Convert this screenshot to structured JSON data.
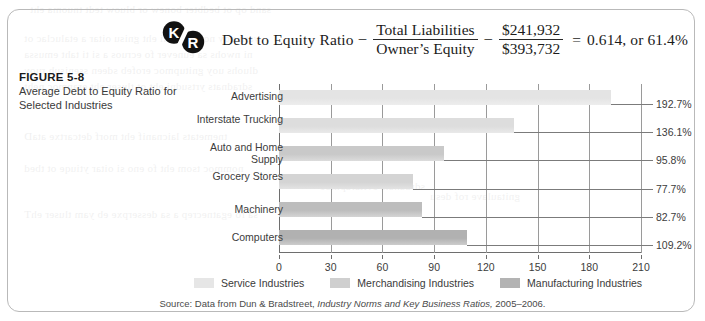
{
  "logo": {
    "left": "K",
    "right": "R",
    "name": "kr-brand-badge"
  },
  "formula": {
    "label": "Debt to Equity Ratio",
    "operator": "–",
    "fraction1_num": "Total Liabilities",
    "fraction1_den": "Owner’s Equity",
    "operator2": "–",
    "fraction2_num": "$241,932",
    "fraction2_den": "$393,732",
    "equals": "=",
    "result": "0.614, or 61.4%"
  },
  "caption": {
    "number": "FIGURE 5-8",
    "title": "Average Debt to Equity Ratio for Selected Industries"
  },
  "legend": [
    {
      "label": "Service Industries",
      "color": "#e6e6e6"
    },
    {
      "label": "Merchandising Industries",
      "color": "#cfcfcf"
    },
    {
      "label": "Manufacturing Industries",
      "color": "#b3b3b3"
    }
  ],
  "source": {
    "prefix": "Source: Data from Dun & Bradstreet, ",
    "italic": "Industry Norms and Key Business Ratios,",
    "suffix": " 2005–2006."
  },
  "chart_data": {
    "type": "bar",
    "orientation": "horizontal",
    "title": "Average Debt to Equity Ratio for Selected Industries",
    "xlabel": "",
    "ylabel": "",
    "xlim": [
      0,
      210
    ],
    "xticks": [
      0,
      30,
      60,
      90,
      120,
      150,
      180,
      210
    ],
    "grid": true,
    "legend_position": "bottom",
    "categories": [
      "Advertising",
      "Interstate Trucking",
      "Auto and Home Supply",
      "Grocery Stores",
      "Machinery",
      "Computers"
    ],
    "values": [
      192.7,
      136.1,
      95.8,
      77.7,
      82.7,
      109.2
    ],
    "value_labels": [
      "192.7%",
      "136.1%",
      "95.8%",
      "77.7%",
      "82.7%",
      "109.2%"
    ],
    "bar_colors": [
      "#e4e4e4",
      "#dddddd",
      "#c9c9c9",
      "#d4d4d4",
      "#bdbdbd",
      "#b1b1b1"
    ],
    "group_of": [
      "Service Industries",
      "Service Industries",
      "Merchandising Industries",
      "Merchandising Industries",
      "Manufacturing Industries",
      "Manufacturing Industries"
    ]
  }
}
